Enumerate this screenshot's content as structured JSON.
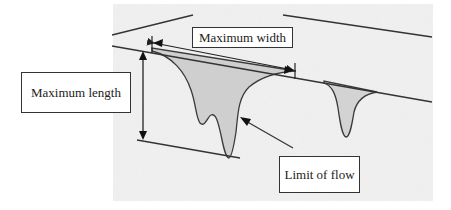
{
  "diagram": {
    "type": "annotated schematic of flow lobes on a slope",
    "labels": {
      "maximum_width": "Maximum width",
      "maximum_length": "Maximum length",
      "limit_of_flow": "Limit of flow"
    },
    "colors": {
      "ground_texture": "#f1f1f1",
      "flow_fill": "#cfcfcf",
      "line": "#333333",
      "box_border": "#333333",
      "text": "#222222"
    },
    "elements": [
      {
        "name": "upper-boundary-line",
        "description": "top edge of slope surface"
      },
      {
        "name": "slope-line",
        "description": "source line where flows originate"
      },
      {
        "name": "main-flow-lobe",
        "description": "large shaded flow with two toes"
      },
      {
        "name": "secondary-flow-lobe",
        "description": "smaller shaded flow to the right"
      },
      {
        "name": "max-width-arrow",
        "description": "double-headed arrow across flow top"
      },
      {
        "name": "max-length-arrow",
        "description": "double-headed vertical arrow"
      },
      {
        "name": "limit-arrow",
        "description": "arrow pointing at flow boundary"
      }
    ]
  }
}
